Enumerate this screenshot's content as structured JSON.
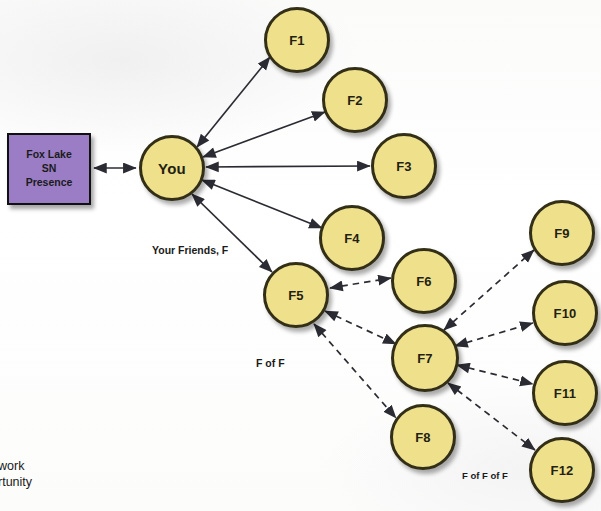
{
  "diagram": {
    "colors": {
      "node_fill": "#efe08c",
      "node_stroke": "#332f17",
      "box_fill": "#9a7dc4",
      "box_stroke": "#111111",
      "edge": "#2b2b33",
      "text": "#231f12",
      "background": "#fdfdfc"
    },
    "source_box": {
      "label_line1": "Fox Lake",
      "label_line2": "SN",
      "label_line3": "Presence",
      "x": 7,
      "y": 133,
      "width": 84,
      "height": 72,
      "font_size": 10.5
    },
    "nodes": [
      {
        "id": "you",
        "label": "You",
        "cx": 172,
        "cy": 168,
        "r": 33,
        "font_size": 15
      },
      {
        "id": "f1",
        "label": "F1",
        "cx": 297,
        "cy": 40,
        "r": 33,
        "font_size": 13
      },
      {
        "id": "f2",
        "label": "F2",
        "cx": 355,
        "cy": 100,
        "r": 33,
        "font_size": 13
      },
      {
        "id": "f3",
        "label": "F3",
        "cx": 404,
        "cy": 166,
        "r": 33,
        "font_size": 13
      },
      {
        "id": "f4",
        "label": "F4",
        "cx": 352,
        "cy": 238,
        "r": 33,
        "font_size": 13
      },
      {
        "id": "f5",
        "label": "F5",
        "cx": 296,
        "cy": 295,
        "r": 33,
        "font_size": 13
      },
      {
        "id": "f6",
        "label": "F6",
        "cx": 424,
        "cy": 281,
        "r": 33,
        "font_size": 13
      },
      {
        "id": "f7",
        "label": "F7",
        "cx": 425,
        "cy": 358,
        "r": 34,
        "font_size": 13
      },
      {
        "id": "f8",
        "label": "F8",
        "cx": 423,
        "cy": 437,
        "r": 33,
        "font_size": 13
      },
      {
        "id": "f9",
        "label": "F9",
        "cx": 562,
        "cy": 233,
        "r": 33,
        "font_size": 13
      },
      {
        "id": "f10",
        "label": "F10",
        "cx": 565,
        "cy": 313,
        "r": 33,
        "font_size": 13
      },
      {
        "id": "f11",
        "label": "F11",
        "cx": 565,
        "cy": 393,
        "r": 33,
        "font_size": 13
      },
      {
        "id": "f12",
        "label": "F12",
        "cx": 562,
        "cy": 470,
        "r": 33,
        "font_size": 13
      }
    ],
    "edges": [
      {
        "from": "box",
        "to": "you",
        "style": "solid",
        "arrows": "both"
      },
      {
        "from": "you",
        "to": "f1",
        "style": "solid",
        "arrows": "both"
      },
      {
        "from": "you",
        "to": "f2",
        "style": "solid",
        "arrows": "both"
      },
      {
        "from": "you",
        "to": "f3",
        "style": "solid",
        "arrows": "both"
      },
      {
        "from": "you",
        "to": "f4",
        "style": "solid",
        "arrows": "both"
      },
      {
        "from": "you",
        "to": "f5",
        "style": "solid",
        "arrows": "both"
      },
      {
        "from": "f5",
        "to": "f6",
        "style": "dashed",
        "arrows": "both"
      },
      {
        "from": "f5",
        "to": "f7",
        "style": "dashed",
        "arrows": "both"
      },
      {
        "from": "f5",
        "to": "f8",
        "style": "dashed",
        "arrows": "both"
      },
      {
        "from": "f7",
        "to": "f9",
        "style": "dashed",
        "arrows": "both"
      },
      {
        "from": "f7",
        "to": "f10",
        "style": "dashed",
        "arrows": "both"
      },
      {
        "from": "f7",
        "to": "f11",
        "style": "dashed",
        "arrows": "both"
      },
      {
        "from": "f7",
        "to": "f12",
        "style": "dashed",
        "arrows": "both"
      }
    ],
    "captions": [
      {
        "id": "your-friends",
        "text": "Your Friends, F",
        "x": 152,
        "y": 244,
        "font_size": 10.5
      },
      {
        "id": "f-of-f",
        "text": "F of F",
        "x": 256,
        "y": 357,
        "font_size": 10.5
      },
      {
        "id": "f-of-f-of-f",
        "text": "F of F of F",
        "x": 462,
        "y": 470,
        "font_size": 9.5
      }
    ],
    "corner_note": {
      "line1": "work",
      "line2": "rtunity",
      "x": -2,
      "y": 458,
      "font_size": 12.5
    }
  }
}
